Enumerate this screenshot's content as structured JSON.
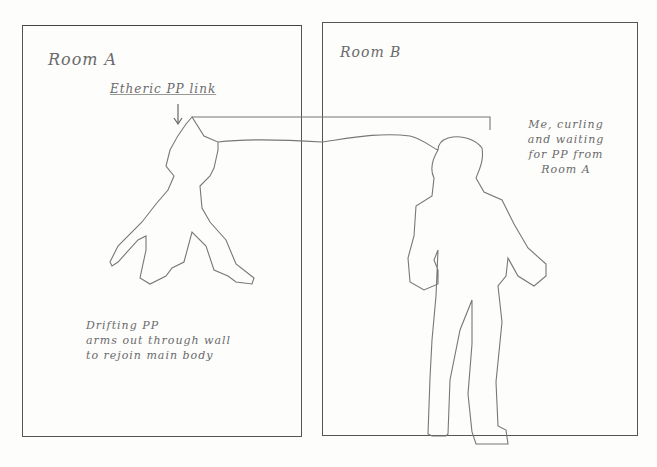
{
  "panels": {
    "room_a": {
      "title": "Room A"
    },
    "room_b": {
      "title": "Room B"
    }
  },
  "annotations": {
    "tether": "Etheric PP link",
    "room_b_note": [
      "Me, curling",
      "and waiting",
      "for PP from",
      "Room A"
    ],
    "room_a_note": [
      "Drifting PP",
      "arms out through wall",
      "to rejoin main body"
    ]
  },
  "colors": {
    "pencil": "#6b6b6b",
    "paper": "#fdfdfc",
    "frame": "#555555"
  }
}
